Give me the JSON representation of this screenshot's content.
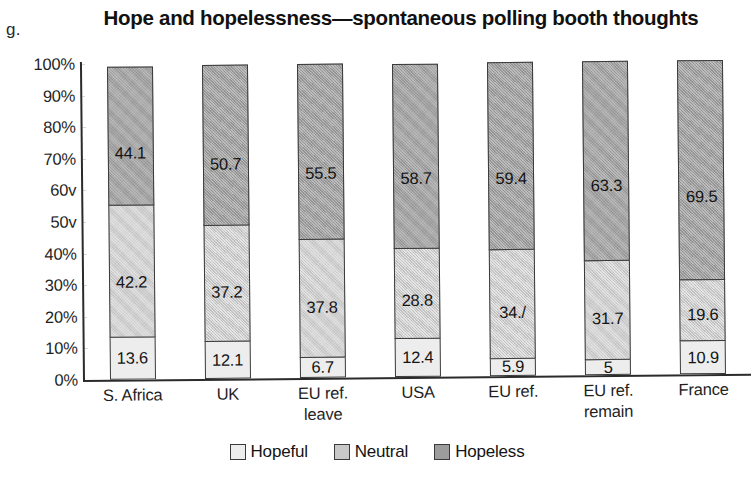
{
  "figure_label": "g.",
  "chart_data": {
    "type": "bar",
    "subtype": "stacked-percentage-column",
    "title": "Hope and hopelessness—spontaneous polling booth thoughts",
    "xlabel": "",
    "ylabel": "",
    "ylim": [
      0,
      100
    ],
    "grid": true,
    "legend_position": "bottom-center",
    "ytick_labels": [
      "100%",
      "90%",
      "80%",
      "70%",
      "60v",
      "50v",
      "40%",
      "30%",
      "20%",
      "10%",
      "0%"
    ],
    "ytick_values": [
      100,
      90,
      80,
      70,
      60,
      50,
      40,
      30,
      20,
      10,
      0
    ],
    "categories": [
      "S. Africa",
      "UK",
      "EU ref. leave",
      "USA",
      "EU ref.",
      "EU ref. remain",
      "France"
    ],
    "category_lines": [
      [
        "S. Africa"
      ],
      [
        "UK"
      ],
      [
        "EU ref.",
        "leave"
      ],
      [
        "USA"
      ],
      [
        "EU ref."
      ],
      [
        "EU ref.",
        "remain"
      ],
      [
        "France"
      ]
    ],
    "series": [
      {
        "name": "Hopeful",
        "color": "#ededed",
        "values": [
          13.6,
          12.1,
          6.7,
          12.4,
          5.9,
          5,
          10.9
        ],
        "labels": [
          "13.6",
          "12.1",
          "6.7",
          "12.4",
          "5.9",
          "5",
          "10.9"
        ]
      },
      {
        "name": "Neutral",
        "color": "#c8c8c8",
        "values": [
          42.2,
          37.2,
          37.8,
          28.8,
          34.7,
          31.7,
          19.6
        ],
        "labels": [
          "42.2",
          "37.2",
          "37.8",
          "28.8",
          "34./",
          "31.7",
          "19.6"
        ]
      },
      {
        "name": "Hopeless",
        "color": "#9c9c9c",
        "values": [
          44.1,
          50.7,
          55.5,
          58.7,
          59.4,
          63.3,
          69.5
        ],
        "labels": [
          "44.1",
          "50.7",
          "55.5",
          "58.7",
          "59.4",
          "63.3",
          "69.5"
        ]
      }
    ]
  },
  "legend": {
    "items": [
      {
        "label": "Hopeful",
        "color": "#ededed"
      },
      {
        "label": "Neutral",
        "color": "#c8c8c8"
      },
      {
        "label": "Hopeless",
        "color": "#9c9c9c"
      }
    ]
  }
}
